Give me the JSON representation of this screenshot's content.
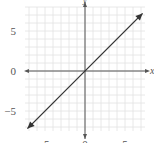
{
  "chart_data": {
    "type": "line",
    "title": "",
    "xlabel": "x",
    "ylabel": "y",
    "xlim": [
      -7.5,
      7.5
    ],
    "ylim": [
      -7.5,
      8
    ],
    "grid": true,
    "grid_step": 1,
    "x_ticks": [
      {
        "value": -5,
        "label": "-5"
      },
      {
        "value": 0,
        "label": "0"
      },
      {
        "value": 5,
        "label": "5"
      }
    ],
    "y_ticks": [
      {
        "value": 5,
        "label": "5"
      },
      {
        "value": 0,
        "label": "0"
      },
      {
        "value": -5,
        "label": "−5"
      }
    ],
    "series": [
      {
        "name": "y = x",
        "x": [
          -7.2,
          7.2
        ],
        "y": [
          -7.2,
          7.2
        ],
        "arrows": "both"
      }
    ],
    "colors": {
      "grid": "#e2e2e2",
      "axis": "#555555",
      "line": "#333333"
    }
  }
}
